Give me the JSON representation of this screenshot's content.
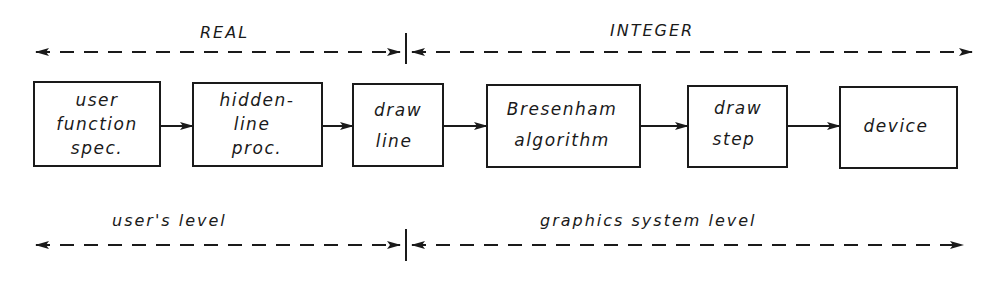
{
  "diagram": {
    "top_scale": {
      "left_label": "REAL",
      "right_label": "INTEGER"
    },
    "bottom_scale": {
      "left_label": "user's level",
      "right_label": "graphics system level"
    },
    "boxes": [
      {
        "id": "user-function-spec",
        "lines": [
          "user",
          "function",
          "spec."
        ]
      },
      {
        "id": "hidden-line-proc",
        "lines": [
          "hidden-",
          "line",
          "proc."
        ]
      },
      {
        "id": "draw-line",
        "lines": [
          "draw",
          "line"
        ]
      },
      {
        "id": "bresenham-algorithm",
        "lines": [
          "Bresenham",
          "algorithm"
        ]
      },
      {
        "id": "draw-step",
        "lines": [
          "draw",
          "step"
        ]
      },
      {
        "id": "device",
        "lines": [
          "device"
        ]
      }
    ],
    "colors": {
      "ink": "#1a1a1a",
      "paper": "#ffffff"
    }
  }
}
